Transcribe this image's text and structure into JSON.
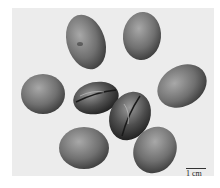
{
  "image": {
    "subject": "eight seeds/beans photographed on a light background",
    "tone": "grayscale",
    "background_color": "#ececec"
  },
  "seeds": [
    {
      "id": "top-left",
      "cx": 86,
      "cy": 42,
      "rx": 19,
      "ry": 28,
      "rotate": -18,
      "shade": "#6e6e6e"
    },
    {
      "id": "top-right",
      "cx": 142,
      "cy": 36,
      "rx": 19,
      "ry": 24,
      "rotate": 5,
      "shade": "#7a7a7a"
    },
    {
      "id": "middle-left",
      "cx": 43,
      "cy": 94,
      "rx": 22,
      "ry": 20,
      "rotate": 0,
      "shade": "#7c7c7c"
    },
    {
      "id": "middle-right",
      "cx": 182,
      "cy": 86,
      "rx": 26,
      "ry": 20,
      "rotate": -30,
      "shade": "#6a6a6a"
    },
    {
      "id": "center-cut-left",
      "cx": 96,
      "cy": 98,
      "rx": 23,
      "ry": 16,
      "rotate": -12,
      "shade": "#444444"
    },
    {
      "id": "center-cut-right",
      "cx": 130,
      "cy": 116,
      "rx": 20,
      "ry": 25,
      "rotate": 25,
      "shade": "#4a4a4a"
    },
    {
      "id": "bottom-left",
      "cx": 84,
      "cy": 148,
      "rx": 25,
      "ry": 21,
      "rotate": 0,
      "shade": "#6a6a6a"
    },
    {
      "id": "bottom-right",
      "cx": 155,
      "cy": 150,
      "rx": 21,
      "ry": 24,
      "rotate": 30,
      "shade": "#6e6e6e"
    }
  ],
  "scale_bar": {
    "label": "1 cm"
  }
}
